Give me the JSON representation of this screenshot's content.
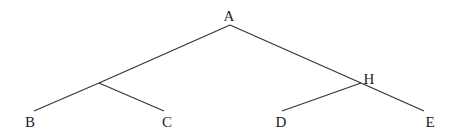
{
  "diagram": {
    "type": "tree",
    "colors": {
      "line": "#333333",
      "text": "#222222",
      "background": "#ffffff"
    },
    "nodes": [
      {
        "id": "A",
        "label": "A",
        "x": 230,
        "y": 25,
        "lx": 229,
        "ly": 21
      },
      {
        "id": "N1",
        "label": "",
        "x": 99,
        "y": 83,
        "lx": 99,
        "ly": 83
      },
      {
        "id": "H",
        "label": "H",
        "x": 361,
        "y": 83,
        "lx": 369,
        "ly": 84
      },
      {
        "id": "B",
        "label": "B",
        "x": 34,
        "y": 111,
        "lx": 30,
        "ly": 127
      },
      {
        "id": "C",
        "label": "C",
        "x": 164,
        "y": 111,
        "lx": 167,
        "ly": 127
      },
      {
        "id": "D",
        "label": "D",
        "x": 282,
        "y": 111,
        "lx": 281,
        "ly": 127
      },
      {
        "id": "E",
        "label": "E",
        "x": 424,
        "y": 111,
        "lx": 430,
        "ly": 127
      }
    ],
    "edges": [
      {
        "from": "A",
        "to": "N1"
      },
      {
        "from": "N1",
        "to": "B"
      },
      {
        "from": "N1",
        "to": "C"
      },
      {
        "from": "A",
        "to": "H"
      },
      {
        "from": "H",
        "to": "D"
      },
      {
        "from": "H",
        "to": "E"
      }
    ]
  }
}
